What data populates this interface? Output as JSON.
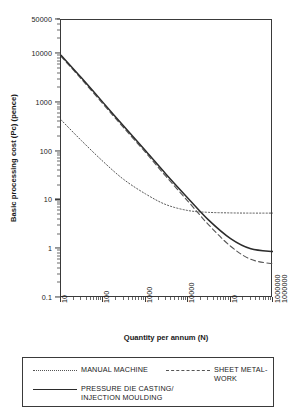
{
  "chart_data": {
    "type": "line",
    "title": "",
    "xlabel": "Quantity per annum (N)",
    "ylabel": "Basic processing cost (Pc) (pence)",
    "xscale": "log",
    "yscale": "log",
    "xlim": [
      10,
      1000000
    ],
    "ylim": [
      0.1,
      50000
    ],
    "grid": false,
    "legend_position": "below-plot",
    "xticks": [
      {
        "value": 10,
        "label": "10"
      },
      {
        "value": 100,
        "label": "100"
      },
      {
        "value": 1000,
        "label": "1000"
      },
      {
        "value": 10000,
        "label": "10000"
      },
      {
        "value": 100000,
        "label": "10"
      },
      {
        "value": 1000000,
        "label": "1000000"
      },
      {
        "value": 1000000,
        "label": "1000000"
      }
    ],
    "yticks": [
      {
        "value": 50000,
        "label": "50000"
      },
      {
        "value": 10000,
        "label": "10000"
      },
      {
        "value": 1000,
        "label": "1000"
      },
      {
        "value": 100,
        "label": "100"
      },
      {
        "value": 10,
        "label": "10"
      },
      {
        "value": 1,
        "label": "1"
      },
      {
        "value": 0.1,
        "label": "0.1"
      }
    ],
    "series": [
      {
        "name": "MANUAL MACHINE",
        "style": "dotted",
        "color": "#555555",
        "x": [
          10,
          30,
          100,
          300,
          1000,
          3000,
          10000,
          30000,
          100000,
          300000,
          1000000
        ],
        "y": [
          450,
          170,
          62,
          27,
          13.5,
          8.2,
          6.2,
          5.7,
          5.55,
          5.5,
          5.5
        ]
      },
      {
        "name": "SHEET METAL-WORK",
        "style": "dashed",
        "color": "#555555",
        "x": [
          10,
          30,
          100,
          300,
          1000,
          3000,
          10000,
          30000,
          100000,
          300000,
          1000000
        ],
        "y": [
          9000,
          3100,
          930,
          310,
          95,
          31,
          9.5,
          3.2,
          1.15,
          0.62,
          0.5
        ]
      },
      {
        "name": "PRESSURE DIE CASTING/\nINJECTION MOULDING",
        "style": "solid",
        "color": "#2b2b2b",
        "x": [
          10,
          30,
          100,
          300,
          1000,
          3000,
          10000,
          30000,
          100000,
          300000,
          1000000
        ],
        "y": [
          9500,
          3300,
          1000,
          335,
          103,
          34.5,
          11,
          4.0,
          1.65,
          1.02,
          0.9
        ]
      }
    ]
  },
  "legend": {
    "items": [
      {
        "label": "MANUAL MACHINE",
        "style": "dotted"
      },
      {
        "label": "SHEET METAL-WORK",
        "style": "dashed"
      },
      {
        "label": "PRESSURE DIE CASTING/\nINJECTION MOULDING",
        "style": "solid"
      }
    ]
  }
}
